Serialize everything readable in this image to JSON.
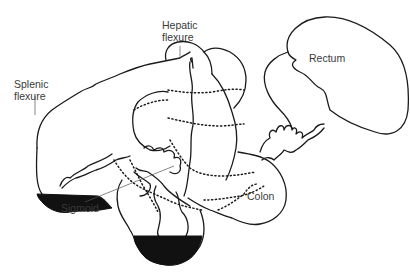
{
  "figure": {
    "type": "anatomical line drawing"
  },
  "labels": {
    "hepatic_flexure": "Hepatic\nflexure",
    "splenic_flexure": "Splenic\nflexure",
    "rectum": "Rectum",
    "sigmoid": "Sigmoid",
    "colon": "Colon"
  },
  "colors": {
    "line": "#1a1a1a",
    "fill": "#111111",
    "label_text": "#3a3a3a",
    "background": "#ffffff"
  }
}
